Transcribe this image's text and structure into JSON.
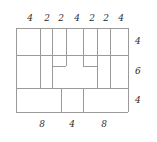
{
  "diagram": {
    "kind": "dimensioned-outline-figure",
    "line_color": "#9a9a9a",
    "line_color_strong": "#8a8a8a",
    "text_color": "#2b2b2b",
    "background": "#ffffff",
    "outline": {
      "x": 16,
      "y": 28,
      "width": 112,
      "height": 84
    },
    "top_dimensions": [
      {
        "value": "4",
        "x": 30,
        "y": 14
      },
      {
        "value": "2",
        "x": 47,
        "y": 14
      },
      {
        "value": "2",
        "x": 61,
        "y": 14
      },
      {
        "value": "4",
        "x": 77,
        "y": 14
      },
      {
        "value": "2",
        "x": 92,
        "y": 14
      },
      {
        "value": "2",
        "x": 106,
        "y": 14
      },
      {
        "value": "4",
        "x": 121,
        "y": 14
      }
    ],
    "bottom_dimensions": [
      {
        "value": "8",
        "x": 42,
        "y": 120
      },
      {
        "value": "4",
        "x": 72,
        "y": 120
      },
      {
        "value": "8",
        "x": 104,
        "y": 120
      }
    ],
    "right_dimensions": [
      {
        "value": "4",
        "x": 139,
        "y": 41
      },
      {
        "value": "6",
        "x": 139,
        "y": 71
      },
      {
        "value": "4",
        "x": 139,
        "y": 100
      }
    ],
    "horizontal_rules": [
      {
        "name": "top-edge",
        "x1": 16,
        "x2": 128,
        "y": 28
      },
      {
        "name": "upper-divider",
        "x1": 16,
        "x2": 128,
        "y": 55
      },
      {
        "name": "lower-divider",
        "x1": 16,
        "x2": 128,
        "y": 88
      },
      {
        "name": "bottom-edge",
        "x1": 16,
        "x2": 128,
        "y": 112
      },
      {
        "name": "left-notch-cap",
        "x1": 52,
        "x2": 66,
        "y": 66
      },
      {
        "name": "right-notch-cap",
        "x1": 83,
        "x2": 97,
        "y": 66
      }
    ],
    "vertical_rules": [
      {
        "name": "left-edge",
        "y1": 28,
        "y2": 112,
        "x": 16
      },
      {
        "name": "v-top-1",
        "y1": 28,
        "y2": 88,
        "x": 40
      },
      {
        "name": "v-top-2",
        "y1": 28,
        "y2": 88,
        "x": 52
      },
      {
        "name": "v-notch-left-inner",
        "y1": 28,
        "y2": 66,
        "x": 66
      },
      {
        "name": "v-notch-right-inner",
        "y1": 28,
        "y2": 66,
        "x": 83
      },
      {
        "name": "v-top-3",
        "y1": 28,
        "y2": 88,
        "x": 97
      },
      {
        "name": "v-top-4",
        "y1": 28,
        "y2": 88,
        "x": 110
      },
      {
        "name": "right-edge",
        "y1": 28,
        "y2": 112,
        "x": 128
      },
      {
        "name": "v-bottom-1",
        "y1": 88,
        "y2": 112,
        "x": 61
      },
      {
        "name": "v-bottom-2",
        "y1": 88,
        "y2": 112,
        "x": 83
      }
    ]
  }
}
